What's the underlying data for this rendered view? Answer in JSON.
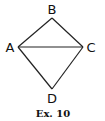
{
  "figure": {
    "caption": "Ex. 10",
    "shape": "quadrilateral ABCD with diagonal AC",
    "stroke_color": "#222222",
    "vertices": {
      "A": {
        "label": "A",
        "x": 18,
        "y": 47
      },
      "B": {
        "label": "B",
        "x": 52,
        "y": 18
      },
      "C": {
        "label": "C",
        "x": 83,
        "y": 47
      },
      "D": {
        "label": "D",
        "x": 52,
        "y": 89
      }
    },
    "edges": [
      {
        "from": "A",
        "to": "B"
      },
      {
        "from": "B",
        "to": "C"
      },
      {
        "from": "C",
        "to": "D"
      },
      {
        "from": "D",
        "to": "A"
      },
      {
        "from": "A",
        "to": "C",
        "kind": "diagonal"
      }
    ]
  }
}
